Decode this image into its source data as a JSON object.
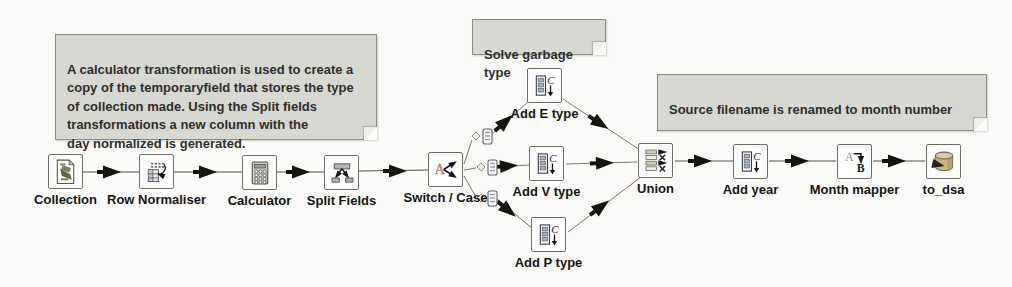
{
  "canvas": {
    "background": "#fbfbf9"
  },
  "notes": [
    {
      "text": "A calculator transformation is used to create a\ncopy of the temporaryfield that stores the type\nof collection made. Using the Split fields\ntransformations a new column with the\nday normalized is generated."
    },
    {
      "text": "Solve garbage type"
    },
    {
      "text": "Source filename is renamed to month number"
    }
  ],
  "steps": [
    {
      "label": "Collection",
      "icon": "file-input-icon"
    },
    {
      "label": "Row Normaliser",
      "icon": "row-normaliser-icon"
    },
    {
      "label": "Calculator",
      "icon": "calculator-icon"
    },
    {
      "label": "Split Fields",
      "icon": "split-fields-icon"
    },
    {
      "label": "Switch / Case",
      "icon": "switch-case-icon"
    },
    {
      "label": "Add E type",
      "icon": "add-constants-icon"
    },
    {
      "label": "Add V type",
      "icon": "add-constants-icon"
    },
    {
      "label": "Add P type",
      "icon": "add-constants-icon"
    },
    {
      "label": "Union",
      "icon": "unique-rows-icon"
    },
    {
      "label": "Add year",
      "icon": "add-constants-icon"
    },
    {
      "label": "Month mapper",
      "icon": "value-mapper-icon"
    },
    {
      "label": "to_dsa",
      "icon": "table-output-icon"
    }
  ],
  "icon_glyphs": {
    "constants": "C",
    "switch": "A",
    "mapper_from": "A",
    "mapper_to": "B"
  },
  "colors": {
    "note_bg": "#d8d8d2",
    "note_border": "#8c8c86",
    "hop_line": "#50504a",
    "arrow": "#141410",
    "switch_letter": "#c4837e",
    "db_body": "#c6b687"
  }
}
